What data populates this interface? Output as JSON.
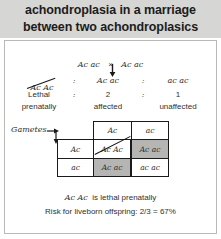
{
  "header": {
    "line1": "achondroplasia in a marriage",
    "line2": "between two achondroplasics",
    "background_color": "#d6d6d4"
  },
  "cross": {
    "parent1": "Ac ac",
    "operator": "×",
    "parent2": "Ac ac",
    "arrow_icon": "down-arrow-icon"
  },
  "offspring_ratio": {
    "genotypes": [
      "Ac Ac",
      "Ac ac",
      "ac ac"
    ],
    "separator": ":",
    "counts": [
      "Lethal",
      "2",
      "1"
    ],
    "descriptions": [
      "prenatally",
      "affected",
      "unaffected"
    ],
    "struck_genotype_index": 0
  },
  "punnett": {
    "gametes_label": "Gametes",
    "column_headers": [
      "Ac",
      "ac"
    ],
    "row_headers": [
      "Ac",
      "ac"
    ],
    "cells": [
      [
        {
          "text": "Ac Ac",
          "shaded": false,
          "struck": true
        },
        {
          "text": "Ac ac",
          "shaded": true,
          "struck": false
        }
      ],
      [
        {
          "text": "Ac ac",
          "shaded": true,
          "struck": false
        },
        {
          "text": "ac ac",
          "shaded": false,
          "struck": false
        }
      ]
    ],
    "shade_color": "#b5b5b3",
    "arrow_right_icon": "arrow-right-icon",
    "arrow_down_icon": "arrow-down-icon"
  },
  "notes": {
    "lethal_genotype": "Ac Ac",
    "lethal_text": "is lethal prenatally",
    "risk_text": "Risk for liveborn offspring:  2/3 = 67%"
  }
}
